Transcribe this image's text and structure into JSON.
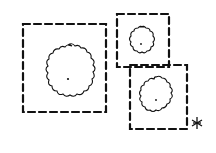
{
  "diagram": {
    "type": "tree-plan-sketch",
    "background": "#ffffff",
    "stroke": "#111111",
    "elements": [
      {
        "kind": "dashed-square",
        "label": "large-plot",
        "x": 23,
        "y": 24,
        "w": 83,
        "h": 88
      },
      {
        "kind": "tree-canopy",
        "label": "large-tree",
        "cx": 68,
        "cy": 78,
        "r": 32
      },
      {
        "kind": "dashed-square",
        "label": "small-plot-top",
        "x": 117,
        "y": 14,
        "w": 52,
        "h": 53
      },
      {
        "kind": "tree-canopy",
        "label": "small-tree-top",
        "cx": 141,
        "cy": 44,
        "r": 17
      },
      {
        "kind": "dashed-square",
        "label": "medium-plot-bottom",
        "x": 130,
        "y": 65,
        "w": 57,
        "h": 64
      },
      {
        "kind": "tree-canopy",
        "label": "medium-tree-bottom",
        "cx": 156,
        "cy": 99,
        "r": 22
      },
      {
        "kind": "mark",
        "label": "star-mark",
        "x": 197,
        "y": 122
      }
    ]
  }
}
